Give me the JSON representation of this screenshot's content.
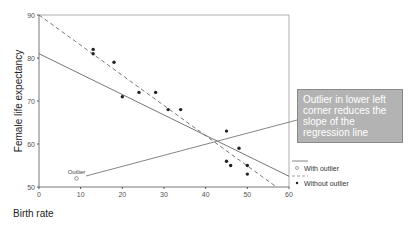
{
  "chart_data": {
    "type": "scatter",
    "title": "",
    "xlabel": "Birth rate",
    "ylabel": "Female life expectancy",
    "xlim": [
      0,
      60
    ],
    "ylim": [
      50,
      90
    ],
    "xticks": [
      0,
      10,
      20,
      30,
      40,
      50,
      60
    ],
    "yticks": [
      50,
      60,
      70,
      80,
      90
    ],
    "grid": false,
    "points": [
      {
        "x": 13,
        "y": 82
      },
      {
        "x": 13,
        "y": 81
      },
      {
        "x": 18,
        "y": 79
      },
      {
        "x": 20,
        "y": 71
      },
      {
        "x": 24,
        "y": 72
      },
      {
        "x": 28,
        "y": 72
      },
      {
        "x": 31,
        "y": 68
      },
      {
        "x": 34,
        "y": 68
      },
      {
        "x": 45,
        "y": 63
      },
      {
        "x": 48,
        "y": 59
      },
      {
        "x": 45,
        "y": 56
      },
      {
        "x": 46,
        "y": 55
      },
      {
        "x": 50,
        "y": 55
      },
      {
        "x": 50,
        "y": 53
      }
    ],
    "outlier": {
      "x": 9,
      "y": 52,
      "label": "Outlier"
    },
    "series": [
      {
        "name": "With outlier",
        "style": "solid",
        "line": {
          "x0": 0,
          "y0": 81,
          "x1": 60,
          "y1": 52.5
        }
      },
      {
        "name": "Without outlier",
        "style": "dashed",
        "line": {
          "x0": 0,
          "y0": 90,
          "x1": 57,
          "y1": 50
        }
      }
    ],
    "annotation": {
      "text": "Outlier in lower left corner reduces the slope of the regression line"
    },
    "legend": {
      "position": "right",
      "entries": [
        {
          "label": "With outlier",
          "marker": "open-circle",
          "line": "solid"
        },
        {
          "label": "Without outlier",
          "marker": "filled-circle",
          "line": "dashed"
        }
      ]
    }
  }
}
